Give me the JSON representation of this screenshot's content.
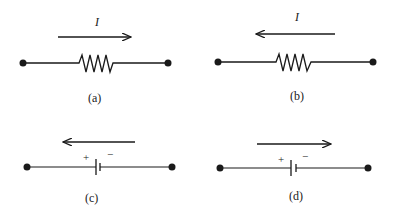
{
  "figure": {
    "panels": [
      {
        "id": "a",
        "caption": "(a)",
        "element": "resistor",
        "current_label": "I",
        "arrow_direction": "right"
      },
      {
        "id": "b",
        "caption": "(b)",
        "element": "resistor",
        "current_label": "I",
        "arrow_direction": "left"
      },
      {
        "id": "c",
        "caption": "(c)",
        "element": "battery",
        "plus_label": "+",
        "minus_label": "−",
        "arrow_direction": "left"
      },
      {
        "id": "d",
        "caption": "(d)",
        "element": "battery",
        "plus_label": "+",
        "minus_label": "−",
        "arrow_direction": "right"
      }
    ],
    "colors": {
      "stroke": "#1a1a1a",
      "background": "#ffffff"
    }
  }
}
